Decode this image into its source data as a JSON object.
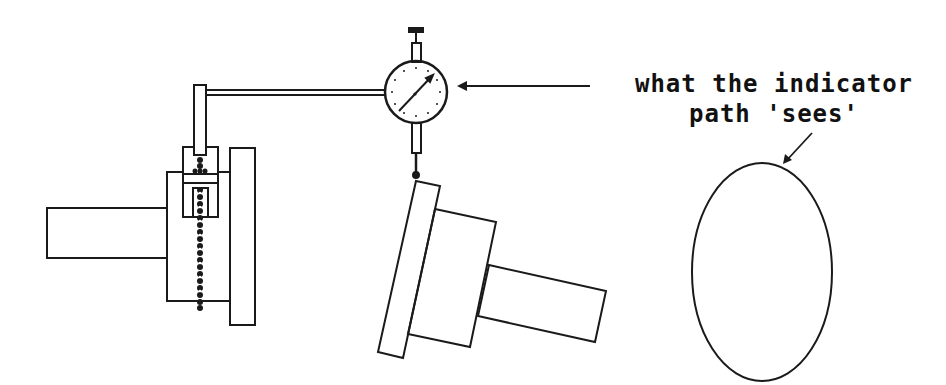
{
  "diagram": {
    "caption": {
      "line1": "what the indicator",
      "line2": "path 'sees'"
    },
    "components": [
      {
        "name": "mounted-workpiece",
        "description": "shaft with hub and flange held in fixture"
      },
      {
        "name": "ball-chain-clamp",
        "description": "clamp with ball chain holding indicator rod"
      },
      {
        "name": "indicator-arm",
        "description": "horizontal arm from rod to dial indicator"
      },
      {
        "name": "dial-indicator",
        "description": "round dial gauge with needle and plunger"
      },
      {
        "name": "tilted-workpiece",
        "description": "misaligned part touched by indicator tip"
      },
      {
        "name": "elliptical-path",
        "description": "ellipse representing what the indicator path sees"
      }
    ],
    "colors": {
      "stroke": "#1a1a1a",
      "background": "#ffffff"
    }
  }
}
